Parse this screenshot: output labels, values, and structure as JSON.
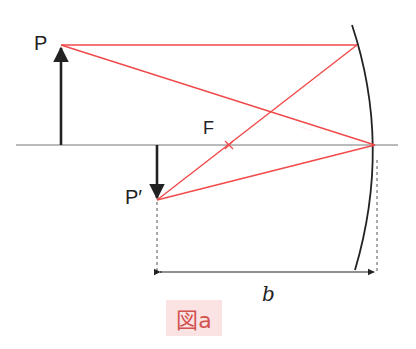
{
  "labels": {
    "object_point": "P",
    "image_point": "P′",
    "focal_point": "F",
    "distance": "b"
  },
  "caption": "図a",
  "colors": {
    "ray": "#f04a4a",
    "axis": "#777777",
    "object": "#222222",
    "mirror": "#222222",
    "caption_bg": "#fbe3e3",
    "caption_text": "#d2524f"
  }
}
